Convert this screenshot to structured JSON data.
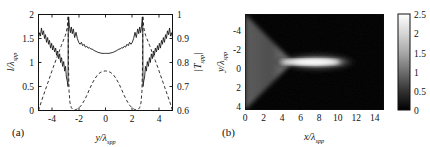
{
  "figure": {
    "panels": [
      {
        "id": "a",
        "label": "(a)",
        "type": "line",
        "xlabel": "y/λ",
        "xlabel_sub": "spp",
        "ylabel_left": "l/λ",
        "ylabel_left_sub": "spp",
        "ylabel_right": "|T",
        "ylabel_right_sub": "spp",
        "ylabel_right_tail": "|",
        "xlim": [
          -5,
          5
        ],
        "ylim_left": [
          0,
          2
        ],
        "ylim_right": [
          0.6,
          1.0
        ],
        "xticks": [
          -4,
          -2,
          0,
          2,
          4
        ],
        "xticklabels": [
          "-4",
          "-2",
          "0",
          "2",
          "4"
        ],
        "yticks_left": [
          0,
          0.5,
          1,
          1.5,
          2
        ],
        "yticklabels_left": [
          "0",
          "0.5",
          "1",
          "1.5",
          "2"
        ],
        "yticks_right": [
          0.6,
          0.7,
          0.8,
          0.9,
          1.0
        ],
        "yticklabels_right": [
          "0.6",
          "0.7",
          "0.8",
          "0.9",
          "1"
        ]
      },
      {
        "id": "b",
        "label": "(b)",
        "type": "heatmap",
        "xlabel": "x/λ",
        "xlabel_sub": "spp",
        "ylabel": "y/λ",
        "ylabel_sub": "spp",
        "xlim": [
          0,
          15
        ],
        "ylim": [
          -5,
          5
        ],
        "xticks": [
          0,
          2,
          4,
          6,
          8,
          10,
          12,
          14
        ],
        "xticklabels": [
          "0",
          "2",
          "4",
          "6",
          "8",
          "10",
          "12",
          "14"
        ],
        "yticks": [
          -4,
          -2,
          0,
          2,
          4
        ],
        "yticklabels": [
          "-4",
          "-2",
          "0",
          "2",
          "4"
        ],
        "y_axis_inverted": true,
        "colorbar": {
          "min": 0,
          "max": 2.5,
          "ticks": [
            0,
            0.5,
            1,
            1.5,
            2,
            2.5
          ],
          "ticklabels": [
            "0",
            "0.5",
            "1",
            "1.5",
            "2",
            "2.5"
          ],
          "colormap": "gray",
          "orientation": "vertical"
        }
      }
    ]
  },
  "chart_data": [
    {
      "type": "line",
      "panel": "a",
      "title": "",
      "xlabel": "y/λ_spp",
      "ylabel": "l/λ_spp",
      "ylabel_secondary": "|T_spp|",
      "xlim": [
        -5,
        5
      ],
      "ylim": [
        0,
        2
      ],
      "ylim_secondary": [
        0.6,
        1.0
      ],
      "grid": false,
      "legend": "none",
      "series": [
        {
          "name": "l/λ_spp",
          "axis": "left",
          "style": "solid",
          "color": "#1a1a1a",
          "x": [
            -5.0,
            -4.92,
            -4.85,
            -4.78,
            -4.7,
            -4.62,
            -4.55,
            -4.48,
            -4.4,
            -4.32,
            -4.25,
            -4.18,
            -4.1,
            -4.02,
            -3.95,
            -3.88,
            -3.8,
            -3.72,
            -3.65,
            -3.58,
            -3.5,
            -3.42,
            -3.35,
            -3.28,
            -3.2,
            -3.12,
            -3.05,
            -2.98,
            -2.92,
            -2.86,
            -2.82,
            -2.8,
            -2.79,
            -2.78,
            -2.75,
            -2.7,
            -2.62,
            -2.55,
            -2.48,
            -2.4,
            -2.3,
            -2.2,
            -2.1,
            -2.0,
            -1.9,
            -1.8,
            -1.7,
            -1.6,
            -1.5,
            -1.4,
            -1.3,
            -1.2,
            -1.1,
            -1.0,
            -0.85,
            -0.7,
            -0.55,
            -0.4,
            -0.25,
            -0.1,
            0.0,
            0.1,
            0.25,
            0.4,
            0.55,
            0.7,
            0.85,
            1.0,
            1.1,
            1.2,
            1.3,
            1.4,
            1.5,
            1.6,
            1.7,
            1.8,
            1.9,
            2.0,
            2.1,
            2.2,
            2.3,
            2.4,
            2.48,
            2.55,
            2.62,
            2.7,
            2.75,
            2.78,
            2.79,
            2.8,
            2.82,
            2.86,
            2.92,
            2.98,
            3.05,
            3.12,
            3.2,
            3.28,
            3.35,
            3.42,
            3.5,
            3.58,
            3.65,
            3.72,
            3.8,
            3.88,
            3.95,
            4.02,
            4.1,
            4.18,
            4.25,
            4.32,
            4.4,
            4.48,
            4.55,
            4.62,
            4.7,
            4.78,
            4.85,
            4.92,
            5.0
          ],
          "y": [
            1.52,
            1.62,
            1.55,
            1.72,
            1.58,
            1.66,
            1.5,
            1.58,
            1.42,
            1.52,
            1.38,
            1.46,
            1.3,
            1.4,
            1.26,
            1.35,
            1.22,
            1.3,
            1.15,
            1.24,
            1.08,
            1.18,
            1.0,
            1.1,
            0.92,
            1.02,
            0.82,
            0.92,
            0.7,
            0.62,
            0.55,
            0.5,
            1.1,
            1.7,
            1.95,
            1.78,
            1.62,
            1.74,
            1.6,
            1.7,
            1.52,
            1.63,
            1.5,
            1.42,
            1.38,
            1.42,
            1.35,
            1.38,
            1.32,
            1.34,
            1.3,
            1.31,
            1.28,
            1.28,
            1.25,
            1.23,
            1.21,
            1.2,
            1.19,
            1.19,
            1.19,
            1.19,
            1.19,
            1.2,
            1.21,
            1.23,
            1.25,
            1.28,
            1.28,
            1.31,
            1.3,
            1.34,
            1.32,
            1.38,
            1.35,
            1.42,
            1.38,
            1.42,
            1.5,
            1.63,
            1.52,
            1.7,
            1.6,
            1.74,
            1.62,
            1.78,
            1.95,
            1.7,
            1.1,
            0.5,
            0.55,
            0.62,
            0.7,
            0.92,
            0.82,
            1.02,
            0.92,
            1.1,
            1.0,
            1.18,
            1.08,
            1.24,
            1.15,
            1.3,
            1.22,
            1.35,
            1.26,
            1.4,
            1.3,
            1.46,
            1.38,
            1.52,
            1.42,
            1.58,
            1.5,
            1.66,
            1.58,
            1.72,
            1.55,
            1.62,
            1.52
          ]
        },
        {
          "name": "|T_spp|",
          "axis": "right",
          "style": "dashed",
          "color": "#1a1a1a",
          "x": [
            -5.0,
            -4.9,
            -4.8,
            -4.7,
            -4.6,
            -4.5,
            -4.4,
            -4.3,
            -4.2,
            -4.1,
            -4.0,
            -3.9,
            -3.8,
            -3.7,
            -3.6,
            -3.5,
            -3.4,
            -3.3,
            -3.2,
            -3.1,
            -3.0,
            -2.92,
            -2.86,
            -2.82,
            -2.8,
            -2.79,
            -2.78,
            -2.76,
            -2.72,
            -2.65,
            -2.55,
            -2.45,
            -2.3,
            -2.15,
            -2.0,
            -1.8,
            -1.6,
            -1.4,
            -1.2,
            -1.0,
            -0.8,
            -0.6,
            -0.4,
            -0.2,
            0.0,
            0.2,
            0.4,
            0.6,
            0.8,
            1.0,
            1.2,
            1.4,
            1.6,
            1.8,
            2.0,
            2.15,
            2.3,
            2.45,
            2.55,
            2.65,
            2.72,
            2.76,
            2.78,
            2.79,
            2.8,
            2.82,
            2.86,
            2.92,
            3.0,
            3.1,
            3.2,
            3.3,
            3.4,
            3.5,
            3.6,
            3.7,
            3.8,
            3.9,
            4.0,
            4.1,
            4.2,
            4.3,
            4.4,
            4.5,
            4.6,
            4.7,
            4.8,
            4.9,
            5.0
          ],
          "y": [
            0.6,
            0.618,
            0.635,
            0.652,
            0.668,
            0.684,
            0.7,
            0.716,
            0.732,
            0.748,
            0.764,
            0.78,
            0.795,
            0.81,
            0.825,
            0.84,
            0.855,
            0.87,
            0.884,
            0.898,
            0.912,
            0.928,
            0.945,
            0.965,
            0.985,
            0.995,
            0.9,
            0.78,
            0.68,
            0.632,
            0.612,
            0.605,
            0.602,
            0.605,
            0.61,
            0.622,
            0.64,
            0.662,
            0.688,
            0.712,
            0.732,
            0.748,
            0.758,
            0.763,
            0.765,
            0.763,
            0.758,
            0.748,
            0.732,
            0.712,
            0.688,
            0.662,
            0.64,
            0.622,
            0.61,
            0.605,
            0.602,
            0.605,
            0.612,
            0.632,
            0.68,
            0.78,
            0.9,
            0.995,
            0.985,
            0.965,
            0.945,
            0.928,
            0.912,
            0.898,
            0.884,
            0.87,
            0.855,
            0.84,
            0.825,
            0.81,
            0.795,
            0.78,
            0.764,
            0.748,
            0.732,
            0.716,
            0.7,
            0.684,
            0.668,
            0.652,
            0.635,
            0.618,
            0.6
          ]
        }
      ]
    },
    {
      "type": "heatmap",
      "panel": "b",
      "title": "",
      "xlabel": "x/λ_spp",
      "ylabel": "y/λ_spp",
      "xlim": [
        0,
        15
      ],
      "ylim": [
        -5,
        5
      ],
      "zlim": [
        0,
        2.5
      ],
      "colormap": "gray",
      "description": "Converging SPP wedge from left edge focusing into a bright horizontal beam",
      "features": {
        "wedge_apex_x": 5.2,
        "wedge_half_width_at_x0": 5.0,
        "beam_x_start": 5.3,
        "beam_x_end": 13.0,
        "beam_half_width": 0.55,
        "beam_peak_value": 2.5,
        "wedge_value": 0.55,
        "background_value": 0.02
      }
    }
  ]
}
